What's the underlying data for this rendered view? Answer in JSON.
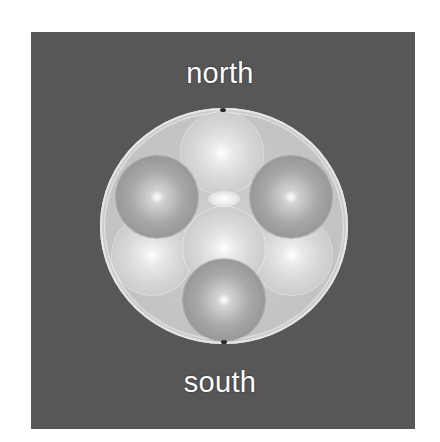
{
  "figure": {
    "background_color": "#575757",
    "labels": {
      "top": "north",
      "bottom": "south"
    },
    "container": {
      "shape": "circle",
      "color": "#c8c8c8",
      "pole_markers": [
        "top",
        "bottom"
      ]
    },
    "spheres": [
      {
        "id": "top",
        "shade": "light",
        "cx": 222,
        "cy": 153,
        "r": 41
      },
      {
        "id": "left",
        "shade": "dark",
        "cx": 157,
        "cy": 197,
        "r": 41
      },
      {
        "id": "right",
        "shade": "dark",
        "cx": 291,
        "cy": 197,
        "r": 41
      },
      {
        "id": "lower-left",
        "shade": "light",
        "cx": 152,
        "cy": 255,
        "r": 40
      },
      {
        "id": "lower-right",
        "shade": "light",
        "cx": 292,
        "cy": 255,
        "r": 40
      },
      {
        "id": "center",
        "shade": "light",
        "cx": 224,
        "cy": 248,
        "r": 41
      },
      {
        "id": "bottom",
        "shade": "dark",
        "cx": 224,
        "cy": 300,
        "r": 41
      }
    ]
  }
}
